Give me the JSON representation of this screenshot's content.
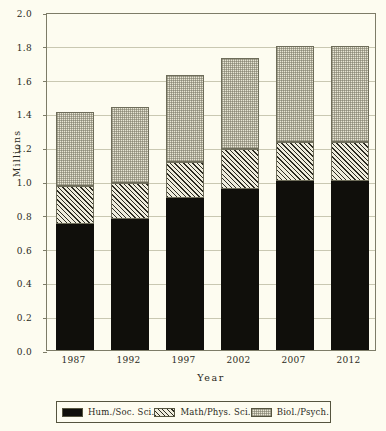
{
  "chart_data": {
    "type": "bar",
    "subtype": "stacked-bar",
    "title": "",
    "xlabel": "Year",
    "ylabel": "Millions",
    "categories": [
      "1987",
      "1992",
      "1997",
      "2002",
      "2007",
      "2012"
    ],
    "ylim": [
      0.0,
      2.0
    ],
    "yticks": [
      "0.0",
      "0.2",
      "0.4",
      "0.6",
      "0.8",
      "1.0",
      "1.2",
      "1.4",
      "1.6",
      "1.8",
      "2.0"
    ],
    "ytick_values": [
      0.0,
      0.2,
      0.4,
      0.6,
      0.8,
      1.0,
      1.2,
      1.4,
      1.6,
      1.8,
      2.0
    ],
    "grid": true,
    "grid_axis": "y",
    "legend_position": "bottom",
    "series": [
      {
        "name": "Hum./Soc. Sci.",
        "pattern": "solid-black",
        "color": "#100f0b",
        "values": [
          0.745,
          0.775,
          0.9,
          0.955,
          1.0,
          1.0
        ]
      },
      {
        "name": "Math/Phys. Sci.",
        "pattern": "diagonal-hatch",
        "color": "#eeecdc",
        "values": [
          0.225,
          0.215,
          0.21,
          0.235,
          0.23,
          0.23
        ]
      },
      {
        "name": "Biol./Psych.",
        "pattern": "dotted-light",
        "color": "#e8e6d4",
        "values": [
          0.44,
          0.45,
          0.52,
          0.54,
          0.57,
          0.57
        ]
      }
    ],
    "cumulative_tops": [
      [
        0.745,
        0.97,
        1.41
      ],
      [
        0.775,
        0.99,
        1.44
      ],
      [
        0.9,
        1.11,
        1.63
      ],
      [
        0.955,
        1.19,
        1.73
      ],
      [
        1.0,
        1.23,
        1.8
      ],
      [
        1.0,
        1.23,
        1.8
      ]
    ],
    "totals": [
      1.41,
      1.44,
      1.63,
      1.73,
      1.8,
      1.8
    ]
  },
  "legend": {
    "entries": [
      {
        "label": "Hum./Soc. Sci."
      },
      {
        "label": "Math/Phys. Sci."
      },
      {
        "label": "Biol./Psych."
      }
    ]
  },
  "colors": {
    "background": "#fdfcf0",
    "frame": "#7d7c68",
    "gridline": "#c9c8b2",
    "text": "#2a2a22"
  }
}
